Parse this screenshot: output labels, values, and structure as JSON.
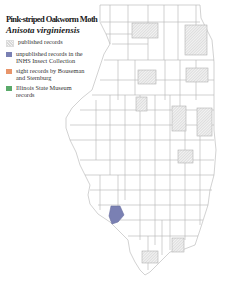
{
  "title": "Pink-striped Oakworm Moth",
  "species": "Anisota virginiensis",
  "legend": [
    {
      "label": "published records",
      "swatch": "hatch",
      "color": "#e6e6e6"
    },
    {
      "label": "unpublished records in the INHS Insect Collection",
      "swatch": "solid",
      "color": "#7a80b3"
    },
    {
      "label": "sight records by Bouseman and Sternburg",
      "swatch": "solid",
      "color": "#e8956a"
    },
    {
      "label": "Illinois State Museum records",
      "swatch": "solid",
      "color": "#5aaa6a"
    }
  ],
  "map": {
    "region": "Illinois counties",
    "published_records_counties": 8,
    "unpublished_records_counties": 1,
    "colors": {
      "border": "#a9a9a9",
      "hatch": "#cfcfcf",
      "unpublished": "#7a80b3"
    }
  }
}
